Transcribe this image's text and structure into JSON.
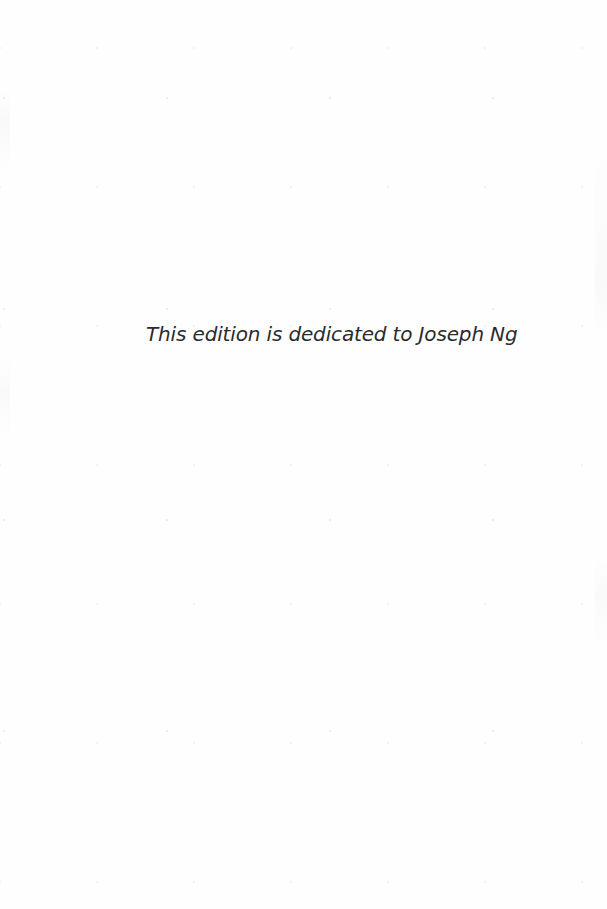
{
  "page": {
    "kind": "book-dedication-page",
    "background_color": "#fefefe",
    "width_px": 607,
    "height_px": 909
  },
  "dedication": {
    "text": "This edition is dedicated to Joseph Ng",
    "color": "#2b2b2d",
    "style": "italic",
    "alignment": "left-of-center"
  }
}
